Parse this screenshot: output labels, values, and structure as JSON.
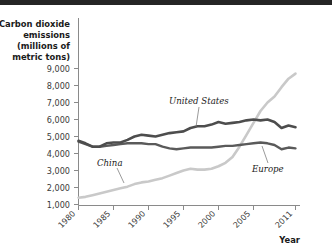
{
  "chart_data": {
    "type": "line",
    "title": "",
    "ylabel": "Carbon dioxide emissions (millions of metric tons)",
    "ylabel_lines": [
      "Carbon dioxide",
      "emissions",
      "(millions of",
      "metric tons)"
    ],
    "xlabel": "Year",
    "ylim": [
      0,
      9000
    ],
    "xlim": [
      1980,
      2011
    ],
    "ytick_labels": [
      "1,000",
      "2,000",
      "3,000",
      "4,000",
      "5,000",
      "6,000",
      "7,000",
      "8,000",
      "9,000"
    ],
    "ytick_values": [
      1000,
      2000,
      3000,
      4000,
      5000,
      6000,
      7000,
      8000,
      9000
    ],
    "xtick_labels": [
      "1980",
      "1985",
      "1990",
      "1995",
      "2000",
      "2005",
      "2011"
    ],
    "xtick_values": [
      1980,
      1985,
      1990,
      1995,
      2000,
      2005,
      2011
    ],
    "grid": false,
    "legend_position": "inline-annotations",
    "x": [
      1980,
      1981,
      1982,
      1983,
      1984,
      1985,
      1986,
      1987,
      1988,
      1989,
      1990,
      1991,
      1992,
      1993,
      1994,
      1995,
      1996,
      1997,
      1998,
      1999,
      2000,
      2001,
      2002,
      2003,
      2004,
      2005,
      2006,
      2007,
      2008,
      2009,
      2010,
      2011
    ],
    "series": [
      {
        "name": "United States",
        "color": "#4d4d4d",
        "label_x": 1996,
        "label_y": 7050,
        "values": [
          4750,
          4600,
          4400,
          4400,
          4600,
          4650,
          4650,
          4800,
          5000,
          5100,
          5050,
          5000,
          5100,
          5200,
          5250,
          5300,
          5500,
          5600,
          5600,
          5700,
          5850,
          5750,
          5800,
          5850,
          5950,
          6000,
          5950,
          6000,
          5850,
          5500,
          5650,
          5550
        ]
      },
      {
        "name": "Europe",
        "color": "#5a5a5a",
        "label_x": 2006,
        "label_y": 3050,
        "values": [
          4700,
          4550,
          4400,
          4400,
          4450,
          4500,
          4550,
          4600,
          4600,
          4600,
          4550,
          4550,
          4400,
          4300,
          4250,
          4300,
          4350,
          4350,
          4350,
          4350,
          4400,
          4450,
          4450,
          4500,
          4550,
          4600,
          4650,
          4600,
          4500,
          4250,
          4350,
          4300
        ]
      },
      {
        "name": "China",
        "color": "#c9c9c9",
        "label_x": 1987,
        "label_y": 3050,
        "values": [
          1400,
          1450,
          1550,
          1650,
          1750,
          1850,
          1950,
          2050,
          2200,
          2300,
          2350,
          2450,
          2550,
          2700,
          2850,
          3000,
          3100,
          3050,
          3050,
          3100,
          3250,
          3450,
          3800,
          4400,
          5100,
          5800,
          6500,
          7000,
          7350,
          7900,
          8400,
          8700
        ]
      }
    ]
  }
}
